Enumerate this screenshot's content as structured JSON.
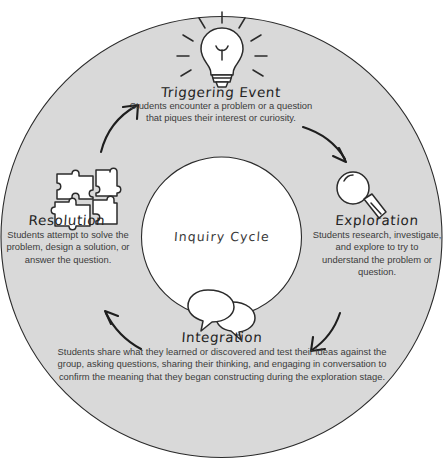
{
  "diagram": {
    "title": "Inquiry Cycle",
    "type": "cycle-diagram",
    "center_label": "Inquiry Cycle",
    "colors": {
      "ring_fill": "#d9d9d9",
      "ring_outline": "#2b2b2b",
      "hub_fill": "#ffffff",
      "text": "#2f2f2f",
      "arrow": "#1e1e1e",
      "background": "#ffffff"
    },
    "stages": [
      {
        "id": "triggering-event",
        "position": "top",
        "icon": "lightbulb-icon",
        "heading": "Triggering Event",
        "body": "Students encounter a problem or a question that piques their interest or curiosity."
      },
      {
        "id": "exploration",
        "position": "right",
        "icon": "magnifying-glass-icon",
        "heading": "Exploration",
        "body": "Students research, investigate, and explore to try to understand the problem or question."
      },
      {
        "id": "integration",
        "position": "bottom",
        "icon": "speech-bubbles-icon",
        "heading": "Integration",
        "body": "Students share what they learned or discovered and test their ideas against the group, asking questions, sharing their thinking, and engaging in conversation to confirm the meaning that they began constructing during the exploration stage."
      },
      {
        "id": "resolution",
        "position": "left",
        "icon": "puzzle-pieces-icon",
        "heading": "Resolution",
        "body": "Students attempt to solve the problem, design a solution, or answer the question."
      }
    ],
    "arrows": [
      {
        "id": "arrow-resolution-to-triggering",
        "from": "resolution",
        "to": "triggering-event",
        "direction": "clockwise"
      },
      {
        "id": "arrow-triggering-to-exploration",
        "from": "triggering-event",
        "to": "exploration",
        "direction": "clockwise"
      },
      {
        "id": "arrow-exploration-to-integration",
        "from": "exploration",
        "to": "integration",
        "direction": "clockwise"
      },
      {
        "id": "arrow-integration-to-resolution",
        "from": "integration",
        "to": "resolution",
        "direction": "clockwise"
      }
    ]
  }
}
